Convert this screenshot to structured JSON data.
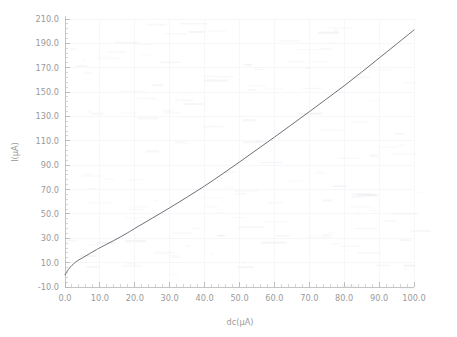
{
  "chart_data": {
    "type": "line",
    "title": "",
    "xlabel": "dc(µA)",
    "ylabel": "I(µA)",
    "xlim": [
      0.0,
      100.0
    ],
    "ylim": [
      -10.0,
      210.0
    ],
    "xticks": [
      "0.0",
      "10.0",
      "20.0",
      "30.0",
      "40.0",
      "50.0",
      "60.0",
      "70.0",
      "80.0",
      "90.0",
      "100.0"
    ],
    "xtick_values": [
      0,
      10,
      20,
      30,
      40,
      50,
      60,
      70,
      80,
      90,
      100
    ],
    "yticks": [
      "-10.0",
      "10.0",
      "30.0",
      "50.0",
      "70.0",
      "90.0",
      "110.0",
      "130.0",
      "150.0",
      "170.0",
      "190.0",
      "210.0"
    ],
    "ytick_values": [
      -10,
      10,
      30,
      50,
      70,
      90,
      110,
      130,
      150,
      170,
      190,
      210
    ],
    "grid": true,
    "legend": null,
    "minor_ticks_per_major": 5,
    "series": [
      {
        "name": "I vs dc",
        "color": "#6f6f78",
        "x": [
          0,
          1,
          2,
          3,
          4,
          5,
          6,
          7,
          8,
          9,
          10,
          12,
          14,
          16,
          18,
          20,
          25,
          30,
          35,
          40,
          45,
          50,
          55,
          60,
          65,
          70,
          75,
          80,
          85,
          90,
          95,
          100
        ],
        "values": [
          0.0,
          4.5,
          7.8,
          10.4,
          12.3,
          13.9,
          15.6,
          17.3,
          19.0,
          20.6,
          22.2,
          25.2,
          28.2,
          31.3,
          34.6,
          38.1,
          46.5,
          55.0,
          63.8,
          72.9,
          82.6,
          92.6,
          102.8,
          113.0,
          123.4,
          133.9,
          144.5,
          155.2,
          166.4,
          177.9,
          189.4,
          201.0
        ]
      }
    ]
  },
  "axes": {
    "x_axis_name": "x-axis",
    "y_axis_name": "y-axis"
  }
}
